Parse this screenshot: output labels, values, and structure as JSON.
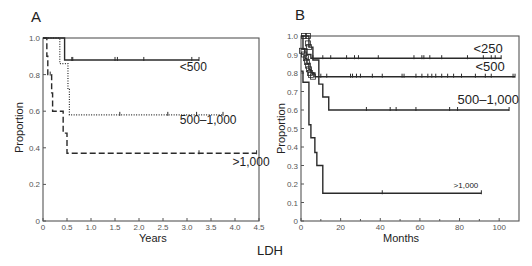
{
  "figure": {
    "common_label": "LDH"
  },
  "chart_data": [
    {
      "panel": "A",
      "type": "line",
      "subtype": "kaplan-meier",
      "title": "A",
      "xlabel": "Years",
      "ylabel": "Proportion",
      "xlim": [
        0,
        4.5
      ],
      "ylim": [
        0,
        1.0
      ],
      "xticks": [
        0,
        0.5,
        1.0,
        1.5,
        2.0,
        2.5,
        3.0,
        3.5,
        4.0,
        4.5
      ],
      "xtick_labels": [
        "0",
        "0.5",
        "1.0",
        "1.5",
        "2.0",
        "2.5",
        "3.0",
        "3.5",
        "4.0",
        "4.5"
      ],
      "yticks": [
        0,
        0.2,
        0.4,
        0.6,
        0.8,
        1.0
      ],
      "ytick_labels": [
        "0",
        "0.2",
        "0.4",
        "0.6",
        "0.8",
        "1.0"
      ],
      "grid": false,
      "legend": "inline labels",
      "series": [
        {
          "name": "<500",
          "style": "solid",
          "steps": [
            [
              0,
              1.0
            ],
            [
              0.45,
              0.88
            ],
            [
              3.25,
              0.88
            ]
          ],
          "censored": [
            0.6,
            0.62,
            1.5,
            1.55,
            2.1,
            3.1,
            3.25
          ],
          "label_pos": [
            2.85,
            0.82
          ]
        },
        {
          "name": "500–1,000",
          "style": "dotted",
          "steps": [
            [
              0,
              1.0
            ],
            [
              0.35,
              0.86
            ],
            [
              0.52,
              0.72
            ],
            [
              0.55,
              0.58
            ],
            [
              3.75,
              0.58
            ]
          ],
          "censored": [
            1.6,
            2.6,
            3.2,
            3.75
          ],
          "label_pos": [
            2.85,
            0.53
          ]
        },
        {
          "name": ">1,000",
          "style": "dashed",
          "steps": [
            [
              0,
              1.0
            ],
            [
              0.08,
              0.9
            ],
            [
              0.1,
              0.8
            ],
            [
              0.18,
              0.7
            ],
            [
              0.2,
              0.6
            ],
            [
              0.42,
              0.48
            ],
            [
              0.5,
              0.37
            ],
            [
              4.45,
              0.37
            ]
          ],
          "censored": [
            0.15,
            3.25,
            4.45
          ],
          "label_pos": [
            3.95,
            0.3
          ]
        }
      ]
    },
    {
      "panel": "B",
      "type": "line",
      "subtype": "kaplan-meier",
      "title": "B",
      "xlabel": "Months",
      "ylabel": "Proportion",
      "xlim": [
        0,
        110
      ],
      "ylim": [
        0,
        1.0
      ],
      "xticks": [
        0,
        20,
        40,
        60,
        80,
        100
      ],
      "xtick_labels": [
        "0",
        "20",
        "40",
        "60",
        "80",
        "100"
      ],
      "minor_xticks": [
        10,
        30,
        50,
        70,
        90
      ],
      "yticks": [
        0,
        0.1,
        0.2,
        0.3,
        0.4,
        0.5,
        0.6,
        0.7,
        0.8,
        0.9,
        1.0
      ],
      "ytick_labels": [
        "0",
        "0.1",
        "0.2",
        "0.3",
        "0.4",
        "0.5",
        "0.6",
        "0.7",
        "0.8",
        "0.9",
        "1.0"
      ],
      "grid": false,
      "legend": "inline labels",
      "series": [
        {
          "name": "<250",
          "style": "solid",
          "steps": [
            [
              0,
              1.0
            ],
            [
              1,
              0.93
            ],
            [
              3,
              0.9
            ],
            [
              5,
              0.88
            ],
            [
              101,
              0.88
            ]
          ],
          "censored": [
            6,
            11,
            15,
            23,
            27,
            29,
            39,
            57,
            61,
            62,
            65,
            71,
            84,
            92,
            96,
            98,
            101
          ],
          "label_pos": [
            87,
            0.91
          ]
        },
        {
          "name": "<500",
          "style": "solid",
          "steps": [
            [
              0,
              0.93
            ],
            [
              2,
              0.88
            ],
            [
              3,
              0.85
            ],
            [
              4,
              0.82
            ],
            [
              5,
              0.8
            ],
            [
              7,
              0.78
            ],
            [
              108,
              0.78
            ]
          ],
          "censored": [
            10,
            13,
            25,
            26,
            28,
            30,
            36,
            41,
            51,
            52,
            58,
            61,
            64,
            66,
            68,
            71,
            74,
            77,
            81,
            88,
            93,
            96,
            107,
            108
          ],
          "label_pos": [
            88,
            0.81
          ]
        },
        {
          "name": "500–1,000",
          "style": "solid",
          "steps": [
            [
              0,
              1.0
            ],
            [
              4,
              0.94
            ],
            [
              6,
              0.87
            ],
            [
              9,
              0.74
            ],
            [
              11,
              0.67
            ],
            [
              14,
              0.6
            ],
            [
              105,
              0.6
            ]
          ],
          "censored": [
            33,
            45,
            48,
            58,
            75,
            79,
            105
          ],
          "label_pos": [
            79,
            0.63
          ]
        },
        {
          "name": ">1,000",
          "style": "solid",
          "steps": [
            [
              0,
              0.81
            ],
            [
              1,
              0.75
            ],
            [
              4,
              0.52
            ],
            [
              5,
              0.45
            ],
            [
              7,
              0.37
            ],
            [
              8,
              0.3
            ],
            [
              11,
              0.15
            ],
            [
              91,
              0.15
            ]
          ],
          "censored": [
            41,
            91
          ],
          "label_pos": [
            77,
            0.18
          ]
        }
      ],
      "label_font_sizes": {
        "<250": 13,
        "<500": 13,
        "500–1,000": 13,
        ">1,000": 8
      }
    }
  ],
  "colors": {
    "line": "#2a2a2a",
    "axis": "#555555",
    "text": "#222222",
    "background": "#ffffff"
  }
}
